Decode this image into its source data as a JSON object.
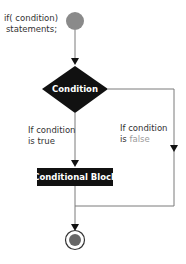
{
  "diagram": {
    "type": "flowchart",
    "title_code": {
      "line1": "if( condition)",
      "line2": "statements;"
    },
    "nodes": {
      "start": {
        "shape": "filled-circle",
        "color": "#8a8a8a"
      },
      "decision": {
        "shape": "diamond",
        "label": "Condition",
        "fill": "#111111"
      },
      "block": {
        "shape": "rectangle",
        "label": "Conditional Block",
        "fill": "#111111"
      },
      "end": {
        "shape": "bullseye",
        "color": "#666666"
      }
    },
    "edges": {
      "true_label_line1": "If condition",
      "true_label_line2_prefix": "is ",
      "true_label_line2_value": "true",
      "false_label_line1": "If condition",
      "false_label_line2_prefix": "is ",
      "false_label_line2_value": "false"
    },
    "colors": {
      "line": "#7a7a7a",
      "node_fill": "#111111",
      "node_text": "#ffffff",
      "label_text": "#333333",
      "muted_text": "#9a9a9a"
    }
  }
}
